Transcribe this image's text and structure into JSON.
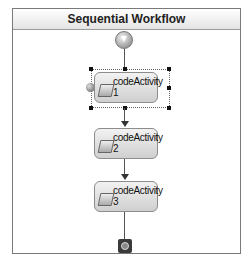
{
  "workflow": {
    "title": "Sequential Workflow",
    "start_icon": "start-arrow-icon",
    "end_icon": "end-stop-icon",
    "activities": [
      {
        "name": "codeActivity",
        "index": "1",
        "selected": true
      },
      {
        "name": "codeActivity",
        "index": "2",
        "selected": false
      },
      {
        "name": "codeActivity",
        "index": "3",
        "selected": false
      }
    ]
  },
  "colors": {
    "frame_border": "#7a7a7a",
    "activity_fill_top": "#f2f2f2",
    "activity_fill_bottom": "#cfcfcf",
    "connector": "#555555"
  }
}
